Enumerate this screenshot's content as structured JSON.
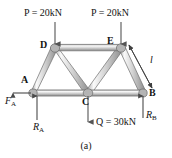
{
  "figure": {
    "caption": "(a)",
    "background_color": "#ffffff",
    "member_fill_light": "#f2f2f2",
    "member_fill_mid": "#c9c9c9",
    "member_edge": "#6e6e6e",
    "arrow_color": "#4a4a4a",
    "text_color": "#141414"
  },
  "nodes": [
    {
      "id": "A",
      "label": "A",
      "x": 33,
      "y": 93,
      "label_x": 22,
      "label_y": 76
    },
    {
      "id": "B",
      "label": "B",
      "x": 143,
      "y": 93,
      "label_x": 148,
      "label_y": 90
    },
    {
      "id": "C",
      "label": "C",
      "x": 88,
      "y": 93,
      "label_x": 82,
      "label_y": 97
    },
    {
      "id": "D",
      "label": "D",
      "x": 55,
      "y": 48,
      "label_x": 41,
      "label_y": 41
    },
    {
      "id": "E",
      "label": "E",
      "x": 121,
      "y": 48,
      "label_x": 108,
      "label_y": 37
    }
  ],
  "members": [
    {
      "from": "A",
      "to": "C",
      "name": "bottom-chord-ac"
    },
    {
      "from": "C",
      "to": "B",
      "name": "bottom-chord-cb"
    },
    {
      "from": "D",
      "to": "E",
      "name": "top-chord-de"
    },
    {
      "from": "A",
      "to": "D",
      "name": "diagonal-ad"
    },
    {
      "from": "D",
      "to": "C",
      "name": "diagonal-dc"
    },
    {
      "from": "C",
      "to": "E",
      "name": "diagonal-ce"
    },
    {
      "from": "E",
      "to": "B",
      "name": "diagonal-eb"
    }
  ],
  "loads": [
    {
      "name": "load-p-left",
      "symbol": "P",
      "equals": " = ",
      "value": "20kN",
      "text": "P = 20kN",
      "at_node": "D",
      "direction": "down",
      "arrow_x": 55,
      "arrow_y_start": 22,
      "arrow_y_end": 45,
      "label_x": 24,
      "label_y": 8
    },
    {
      "name": "load-p-right",
      "symbol": "P",
      "equals": " = ",
      "value": "20kN",
      "text": "P = 20kN",
      "at_node": "E",
      "direction": "down",
      "arrow_x": 121,
      "arrow_y_start": 22,
      "arrow_y_end": 45,
      "label_x": 91,
      "label_y": 8
    },
    {
      "name": "load-q",
      "symbol": "Q",
      "equals": " = ",
      "value": "30kN",
      "text": "Q = 30kN",
      "at_node": "C",
      "direction": "down",
      "arrow_x": 88,
      "arrow_y_start": 94,
      "arrow_y_end": 124,
      "label_x": 96,
      "label_y": 117
    }
  ],
  "reactions": [
    {
      "name": "reaction-fa",
      "symbol": "F",
      "subscript": "A",
      "text": "F",
      "at_node": "A",
      "direction": "left",
      "arrow_x_start": 33,
      "arrow_x_end": 10,
      "arrow_y": 93,
      "label_x": 8,
      "label_y": 97
    },
    {
      "name": "reaction-ra",
      "symbol": "R",
      "subscript": "A",
      "text": "R",
      "at_node": "A",
      "direction": "up",
      "arrow_x": 37,
      "arrow_y_start": 120,
      "arrow_y_end": 94,
      "label_x": 33,
      "label_y": 122
    },
    {
      "name": "reaction-rb",
      "symbol": "R",
      "subscript": "B",
      "text": "R",
      "at_node": "B",
      "direction": "up",
      "arrow_x": 143,
      "arrow_y_start": 120,
      "arrow_y_end": 94,
      "label_x": 145,
      "label_y": 112
    }
  ],
  "dimensions": [
    {
      "name": "dimension-l",
      "label": "l",
      "member": "EB",
      "x1": 128,
      "y1": 45,
      "x2": 152,
      "y2": 88,
      "label_x": 148,
      "label_y": 57
    }
  ]
}
